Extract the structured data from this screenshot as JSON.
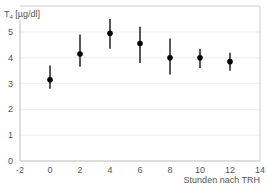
{
  "chart_data": {
    "type": "scatter",
    "title": "",
    "ylabel": "T4 [µg/dl]",
    "xlabel": "Stunden nach TRH",
    "xlim": [
      -2,
      14
    ],
    "ylim": [
      0,
      6
    ],
    "x_ticks": [
      "-2",
      "0",
      "2",
      "4",
      "6",
      "8",
      "10",
      "12",
      "14"
    ],
    "y_ticks": [
      "0",
      "1",
      "2",
      "3",
      "4",
      "5"
    ],
    "grid": true,
    "series": [
      {
        "name": "T4",
        "x": [
          0,
          2,
          4,
          6,
          8,
          10,
          12
        ],
        "y": [
          3.15,
          4.15,
          4.95,
          4.55,
          4.0,
          4.0,
          3.85
        ],
        "err_low": [
          2.8,
          3.65,
          4.35,
          3.8,
          3.35,
          3.6,
          3.5
        ],
        "err_high": [
          3.7,
          4.9,
          5.5,
          5.2,
          4.75,
          4.35,
          4.2
        ]
      }
    ]
  },
  "labels": {
    "y_axis_main": "T",
    "y_axis_sub": "4",
    "y_axis_unit": " [µg/dl]",
    "x_axis": "Stunden nach TRH"
  }
}
